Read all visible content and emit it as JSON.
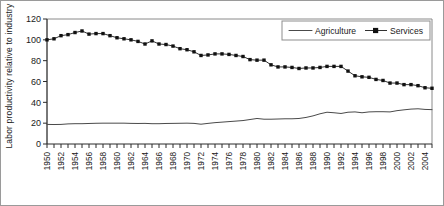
{
  "chart_data": {
    "type": "line",
    "title": "",
    "xlabel": "",
    "ylabel": "Labor productivity relative to industry",
    "ylim": [
      0,
      120
    ],
    "ytick_labels": [
      "0",
      "20",
      "40",
      "60",
      "80",
      "100",
      "120"
    ],
    "yticks": [
      0,
      20,
      40,
      60,
      80,
      100,
      120
    ],
    "xlim": [
      1950,
      2005
    ],
    "grid": false,
    "legend_position": "top-right",
    "legend": [
      "Agriculture",
      "Services"
    ],
    "x": [
      1950,
      1951,
      1952,
      1953,
      1954,
      1955,
      1956,
      1957,
      1958,
      1959,
      1960,
      1961,
      1962,
      1963,
      1964,
      1965,
      1966,
      1967,
      1968,
      1969,
      1970,
      1971,
      1972,
      1973,
      1974,
      1975,
      1976,
      1977,
      1978,
      1979,
      1980,
      1981,
      1982,
      1983,
      1984,
      1985,
      1986,
      1987,
      1988,
      1989,
      1990,
      1991,
      1992,
      1993,
      1994,
      1995,
      1996,
      1997,
      1998,
      1999,
      2000,
      2001,
      2002,
      2003,
      2004,
      2005
    ],
    "xtick_labels": [
      "1950",
      "1952",
      "1954",
      "1956",
      "1958",
      "1960",
      "1962",
      "1964",
      "1966",
      "1968",
      "1970",
      "1972",
      "1974",
      "1976",
      "1978",
      "1980",
      "1982",
      "1984",
      "1986",
      "1988",
      "1990",
      "1992",
      "1994",
      "1996",
      "1998",
      "2000",
      "2002",
      "2004"
    ],
    "series": [
      {
        "name": "Services",
        "marker": "square",
        "values": [
          100,
          101,
          104,
          105,
          107,
          108.5,
          105.5,
          106,
          106,
          104,
          102,
          101,
          100,
          98.5,
          96,
          99,
          96,
          95.5,
          94,
          91.5,
          90.5,
          88.5,
          85,
          85.5,
          86.5,
          86.5,
          86,
          85,
          84,
          81,
          80.5,
          80.5,
          76,
          74,
          74,
          73.5,
          72.5,
          73,
          73,
          73.5,
          74.5,
          74.5,
          74.5,
          70,
          65.5,
          64.5,
          64,
          62,
          61,
          58.5,
          58.5,
          57,
          57,
          56,
          54,
          53.5
        ]
      },
      {
        "name": "Agriculture",
        "marker": "none",
        "values": [
          18.8,
          18.7,
          18.8,
          19.3,
          19.5,
          19.5,
          19.7,
          19.9,
          20,
          20,
          20,
          20,
          19.8,
          19.7,
          19.8,
          19.5,
          19.5,
          19.7,
          19.8,
          19.9,
          20,
          19.8,
          19,
          19.8,
          20.5,
          21,
          21.5,
          22,
          22.5,
          23.5,
          24.5,
          23.8,
          23.8,
          24,
          24.2,
          24.2,
          24.5,
          25.5,
          27,
          29,
          30.5,
          30,
          29.3,
          30.5,
          30.8,
          30,
          30.8,
          31,
          31,
          30.8,
          32,
          32.8,
          33.5,
          33.8,
          33.2,
          33
        ]
      }
    ]
  }
}
